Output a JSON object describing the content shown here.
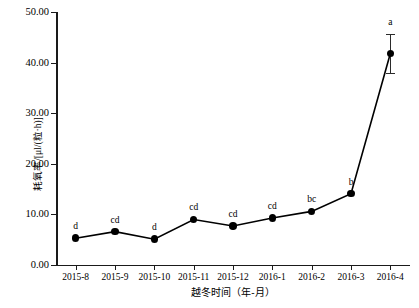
{
  "chart_data": {
    "type": "line",
    "title": "",
    "xlabel": "越冬时间（年-月）",
    "ylabel": "耗氧率/[μl/(粒·h)]",
    "categories": [
      "2015-8",
      "2015-9",
      "2015-10",
      "2015-11",
      "2015-12",
      "2016-1",
      "2016-2",
      "2016-3",
      "2016-4"
    ],
    "values": [
      5.3,
      6.6,
      5.1,
      9.0,
      7.7,
      9.3,
      10.6,
      14.1,
      41.8
    ],
    "errors": [
      0,
      0,
      0,
      0,
      0,
      0,
      0,
      0,
      3.9
    ],
    "point_labels": [
      "d",
      "cd",
      "d",
      "cd",
      "cd",
      "cd",
      "bc",
      "b",
      "a"
    ],
    "ylim": [
      0,
      50
    ],
    "ytick_values": [
      0,
      10,
      20,
      30,
      40,
      50
    ],
    "ytick_labels": [
      "0.00",
      "10.00",
      "20.00",
      "30.00",
      "40.00",
      "50.00"
    ],
    "grid": false,
    "legend": "none",
    "marker": "filled-circle",
    "line_color": "#000000",
    "marker_color": "#000000"
  }
}
